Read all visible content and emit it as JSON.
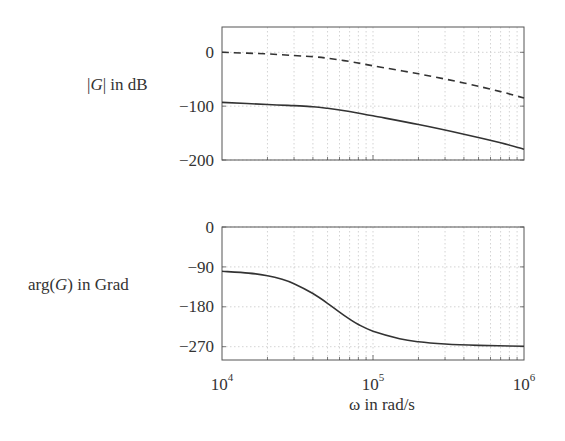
{
  "chart_data": [
    {
      "type": "line",
      "title": "",
      "xlabel": "",
      "ylabel": "|G| in dB",
      "xscale": "log",
      "xlim": [
        10000,
        1000000
      ],
      "ylim": [
        -200,
        47
      ],
      "yticks": [
        0,
        -100,
        -200
      ],
      "ytick_labels": [
        "0",
        "−100",
        "−200"
      ],
      "grid": true,
      "series": [
        {
          "name": "dashed",
          "style": "dashed",
          "x": [
            10000,
            20000,
            30000,
            40000,
            50000,
            70000,
            100000,
            200000,
            400000,
            700000,
            1000000
          ],
          "values": [
            0,
            -3,
            -6,
            -8,
            -11,
            -17,
            -25,
            -40,
            -57,
            -73,
            -85
          ]
        },
        {
          "name": "solid",
          "style": "solid",
          "x": [
            10000,
            20000,
            30000,
            40000,
            50000,
            70000,
            100000,
            200000,
            400000,
            700000,
            1000000
          ],
          "values": [
            -93,
            -97,
            -99,
            -101,
            -104,
            -110,
            -118,
            -134,
            -152,
            -168,
            -180
          ]
        }
      ]
    },
    {
      "type": "line",
      "title": "",
      "xlabel": "ω  in rad/s",
      "ylabel": "arg(G)  in Grad",
      "xscale": "log",
      "xlim": [
        10000,
        1000000
      ],
      "ylim": [
        -300,
        0
      ],
      "yticks": [
        0,
        -90,
        -180,
        -270
      ],
      "ytick_labels": [
        "0",
        "−90",
        "−180",
        "−270"
      ],
      "xticks": [
        10000,
        100000,
        1000000
      ],
      "xtick_labels": [
        "10^4",
        "10^5",
        "10^6"
      ],
      "grid": true,
      "series": [
        {
          "name": "phase",
          "style": "solid",
          "x": [
            10000,
            15000,
            20000,
            25000,
            30000,
            40000,
            50000,
            60000,
            70000,
            80000,
            100000,
            150000,
            200000,
            300000,
            500000,
            1000000
          ],
          "values": [
            -100,
            -104,
            -110,
            -118,
            -128,
            -150,
            -172,
            -192,
            -208,
            -220,
            -235,
            -252,
            -259,
            -264,
            -267,
            -269
          ]
        }
      ]
    }
  ],
  "labels": {
    "top_ylabel_G": "G",
    "top_ylabel_rest": " in dB",
    "bottom_ylabel_pre": "arg(",
    "bottom_ylabel_G": "G",
    "bottom_ylabel_post": ")  in Grad",
    "xlabel": "ω  in rad/s",
    "xtick_base": "10",
    "xtick_exps": [
      "4",
      "5",
      "6"
    ],
    "top_yticks": [
      "0",
      "−100",
      "−200"
    ],
    "bottom_yticks": [
      "0",
      "−90",
      "−180",
      "−270"
    ]
  },
  "colors": {
    "line": "#333333",
    "axes": "#555555",
    "grid": "#c8c8c8"
  }
}
